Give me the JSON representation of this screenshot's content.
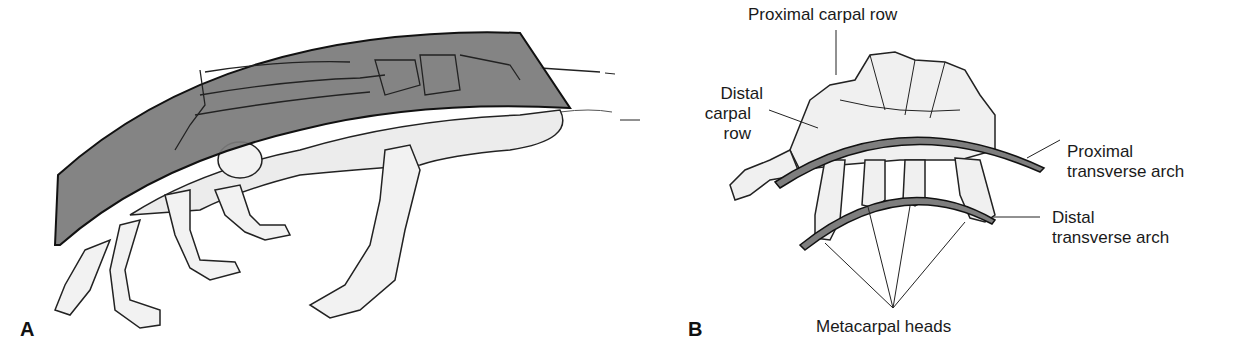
{
  "figure": {
    "panels": [
      {
        "id": "A",
        "letter": "A",
        "description": "Lateral view of hand skeleton with shaded longitudinal arch band"
      },
      {
        "id": "B",
        "letter": "B",
        "description": "Carpal and metacarpal bones showing transverse arches"
      }
    ],
    "labels": {
      "proximal_carpal_row": "Proximal carpal row",
      "distal_carpal_row_line1": "Distal",
      "distal_carpal_row_line2": "carpal row",
      "proximal_arch_line1": "Proximal",
      "proximal_arch_line2": "transverse arch",
      "distal_arch_line1": "Distal",
      "distal_arch_line2": "transverse arch",
      "metacarpal_heads": "Metacarpal heads",
      "panel_a": "A",
      "panel_b": "B"
    },
    "colors": {
      "band_fill": "#7a7a7a",
      "arch_fill": "#808080",
      "bone_fill": "#f2f2f2",
      "outline": "#111111"
    }
  }
}
